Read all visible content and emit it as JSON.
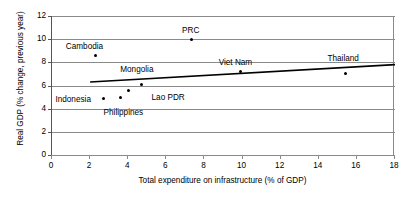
{
  "chart_data": {
    "type": "scatter",
    "title": "",
    "xlabel": "Total expenditure on infrastructure (% of GDP)",
    "ylabel": "Real GDP (% change, previous year)",
    "xlim": [
      0,
      18
    ],
    "ylim": [
      0,
      12
    ],
    "xticks": [
      0,
      2,
      4,
      6,
      8,
      10,
      12,
      14,
      16,
      18
    ],
    "yticks": [
      0,
      2,
      4,
      6,
      8,
      10,
      12
    ],
    "grid": "horizontal",
    "legend": "none",
    "points": [
      {
        "label": "Cambodia",
        "x": 2.3,
        "y": 8.55,
        "label_dx": -30,
        "label_dy": -14
      },
      {
        "label": "PRC",
        "x": 7.3,
        "y": 9.95,
        "label_dx": -9,
        "label_dy": -14
      },
      {
        "label": "Indonesia",
        "x": 2.7,
        "y": 4.85,
        "label_dx": -48,
        "label_dy": -4
      },
      {
        "label": "Philippines",
        "x": 3.6,
        "y": 4.95,
        "label_dx": -17,
        "label_dy": 10
      },
      {
        "label": "Mongolia",
        "x": 4.0,
        "y": 5.6,
        "label_dx": -8,
        "label_dy": -25
      },
      {
        "label": "Lao PDR",
        "x": 4.7,
        "y": 6.05,
        "label_dx": 10,
        "label_dy": 8
      },
      {
        "label": "Viet Nam",
        "x": 9.9,
        "y": 7.2,
        "label_dx": -22,
        "label_dy": -14
      },
      {
        "label": "Thailand",
        "x": 15.4,
        "y": 7.0,
        "label_dx": -18,
        "label_dy": -20
      }
    ],
    "trendline": {
      "x0": 2.0,
      "y0": 6.3,
      "x1": 18.0,
      "y1": 7.8,
      "color": "#000000"
    }
  }
}
